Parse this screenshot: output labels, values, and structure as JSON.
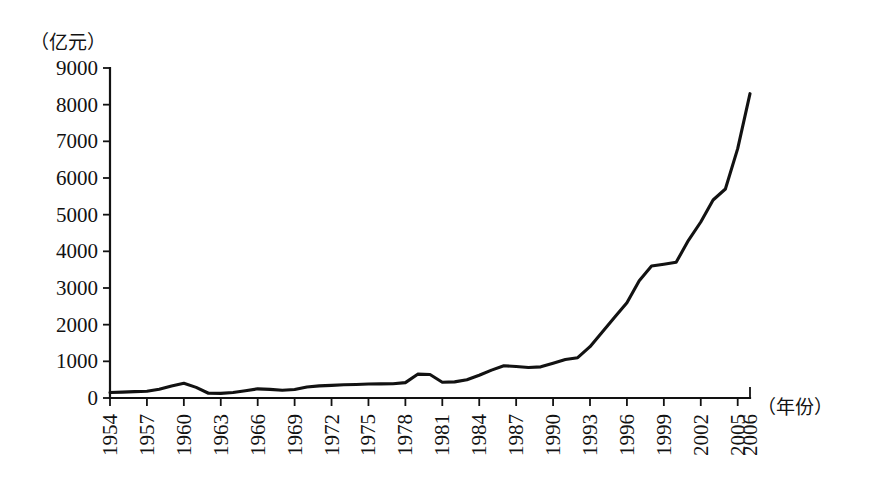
{
  "chart_data": {
    "type": "line",
    "title": "",
    "subtitle": "",
    "xlabel": "（年份）",
    "ylabel": "（亿元）",
    "xlim": [
      1954,
      2006
    ],
    "ylim": [
      0,
      9000
    ],
    "grid": false,
    "legend": null,
    "y_ticks": [
      0,
      1000,
      2000,
      3000,
      4000,
      5000,
      6000,
      7000,
      8000,
      9000
    ],
    "y_tick_labels": [
      "0",
      "1000",
      "2000",
      "3000",
      "4000",
      "5000",
      "6000",
      "7000",
      "8000",
      "9000"
    ],
    "x_ticks": [
      1954,
      1957,
      1960,
      1963,
      1966,
      1969,
      1972,
      1975,
      1978,
      1981,
      1984,
      1987,
      1990,
      1993,
      1996,
      1999,
      2002,
      2005,
      2006
    ],
    "x_tick_labels": [
      "1954",
      "1957",
      "1960",
      "1963",
      "1966",
      "1969",
      "1972",
      "1975",
      "1978",
      "1981",
      "1984",
      "1987",
      "1990",
      "1993",
      "1996",
      "1999",
      "2002",
      "2005",
      "2006"
    ],
    "series": [
      {
        "name": "",
        "x": [
          1954,
          1955,
          1956,
          1957,
          1958,
          1959,
          1960,
          1961,
          1962,
          1963,
          1964,
          1965,
          1966,
          1967,
          1968,
          1969,
          1970,
          1971,
          1972,
          1973,
          1974,
          1975,
          1976,
          1977,
          1978,
          1979,
          1980,
          1981,
          1982,
          1983,
          1984,
          1985,
          1986,
          1987,
          1988,
          1989,
          1990,
          1991,
          1992,
          1993,
          1994,
          1995,
          1996,
          1997,
          1998,
          1999,
          2000,
          2001,
          2002,
          2003,
          2004,
          2005,
          2006
        ],
        "values": [
          150,
          160,
          175,
          185,
          240,
          330,
          400,
          290,
          130,
          125,
          150,
          200,
          250,
          235,
          210,
          230,
          300,
          330,
          345,
          360,
          370,
          380,
          385,
          390,
          420,
          650,
          640,
          430,
          440,
          500,
          620,
          760,
          880,
          860,
          830,
          850,
          950,
          1050,
          1100,
          1400,
          1800,
          2200,
          2600,
          3200,
          3600,
          3650,
          3700,
          4300,
          4800,
          5400,
          5700,
          6800,
          8300
        ]
      }
    ],
    "annotations": {
      "axis_unit_note": "（亿元）",
      "axis_year_note": "（年份）"
    }
  }
}
